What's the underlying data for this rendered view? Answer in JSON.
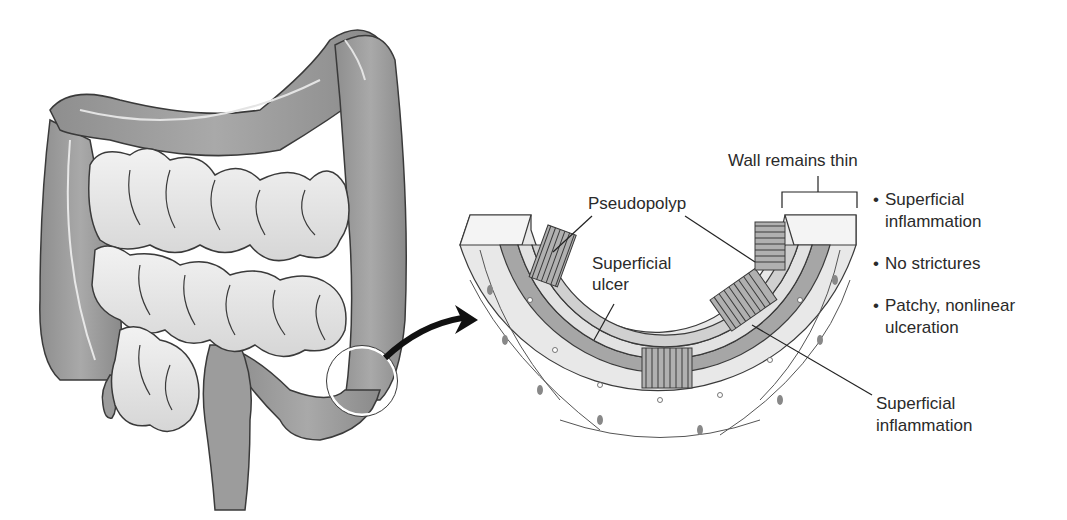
{
  "figure": {
    "left_panel": "Colon and small intestine with magnified region circled on descending colon",
    "right_panel": "Cross-section of colon wall"
  },
  "labels": {
    "wall_remains_thin": "Wall remains thin",
    "pseudopolyp": "Pseudopolyp",
    "superficial_ulcer_1": "Superficial",
    "superficial_ulcer_2": "ulcer",
    "superficial_inflammation_1": "Superficial",
    "superficial_inflammation_2": "inflammation"
  },
  "bullets": [
    {
      "line1": "Superficial",
      "line2": "inflammation"
    },
    {
      "line1": "No strictures",
      "line2": ""
    },
    {
      "line1": "Patchy, nonlinear",
      "line2": "ulceration"
    }
  ],
  "colors": {
    "colon": "#9a9a9a",
    "small_intestine": "#e2e2e2",
    "outline": "#3a3a3a",
    "wall_outer": "#e6e6e6",
    "wall_muscle": "#a8a8a8",
    "mucosa": "#cfcfcf"
  }
}
